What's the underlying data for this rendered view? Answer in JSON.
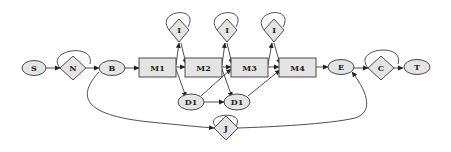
{
  "diagram": {
    "type": "flow-graph",
    "nodes": {
      "S": {
        "label": "S",
        "shape": "ellipse"
      },
      "N": {
        "label": "N",
        "shape": "diamond"
      },
      "B": {
        "label": "B",
        "shape": "ellipse"
      },
      "M1": {
        "label": "M1",
        "shape": "rect"
      },
      "M2": {
        "label": "M2",
        "shape": "rect"
      },
      "M3": {
        "label": "M3",
        "shape": "rect"
      },
      "M4": {
        "label": "M4",
        "shape": "rect"
      },
      "I1": {
        "label": "I",
        "shape": "diamond"
      },
      "I2": {
        "label": "I",
        "shape": "diamond"
      },
      "I3": {
        "label": "I",
        "shape": "diamond"
      },
      "D1a": {
        "label": "D1",
        "shape": "ellipse"
      },
      "D1b": {
        "label": "D1",
        "shape": "ellipse"
      },
      "E": {
        "label": "E",
        "shape": "ellipse"
      },
      "C": {
        "label": "C",
        "shape": "diamond"
      },
      "T": {
        "label": "T",
        "shape": "ellipse"
      },
      "J": {
        "label": "J",
        "shape": "diamond"
      }
    },
    "edges": [
      [
        "S",
        "N"
      ],
      [
        "N",
        "N"
      ],
      [
        "N",
        "B"
      ],
      [
        "B",
        "M1"
      ],
      [
        "M1",
        "M2"
      ],
      [
        "M2",
        "M3"
      ],
      [
        "M3",
        "M4"
      ],
      [
        "M4",
        "E"
      ],
      [
        "M1",
        "I1"
      ],
      [
        "I1",
        "I1"
      ],
      [
        "I1",
        "M2"
      ],
      [
        "M2",
        "I2"
      ],
      [
        "I2",
        "I2"
      ],
      [
        "I2",
        "M3"
      ],
      [
        "M3",
        "I3"
      ],
      [
        "I3",
        "I3"
      ],
      [
        "I3",
        "M4"
      ],
      [
        "M1",
        "D1a"
      ],
      [
        "D1a",
        "M3"
      ],
      [
        "D1a",
        "D1b"
      ],
      [
        "M2",
        "D1b"
      ],
      [
        "D1b",
        "M4"
      ],
      [
        "E",
        "C"
      ],
      [
        "C",
        "C"
      ],
      [
        "C",
        "T"
      ],
      [
        "B",
        "J"
      ],
      [
        "J",
        "J"
      ],
      [
        "J",
        "E"
      ]
    ],
    "colors": {
      "node_fill": "#e4e4e4",
      "stroke": "#4a4a4a",
      "background": "#ffffff"
    }
  }
}
